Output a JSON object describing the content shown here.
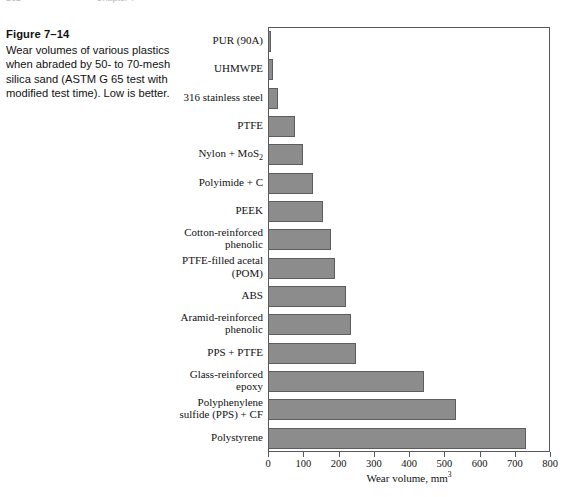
{
  "page_header": {
    "left": "262",
    "right": "Chapter 7"
  },
  "caption": {
    "figure_number": "Figure 7–14",
    "description": "Wear volumes of various plastics when abraded by 50- to 70-mesh silica sand (ASTM G 65 test with modified test time). Low is better."
  },
  "colors": {
    "bar_fill": "#8c8c8c",
    "bar_stroke": "#5d5d5d",
    "axis": "#58585a",
    "text": "#111111"
  },
  "chart_data": {
    "type": "bar",
    "orientation": "horizontal",
    "title": "",
    "xlabel": "Wear volume, mm³",
    "ylabel": "",
    "xlim": [
      0,
      800
    ],
    "xticks": [
      0,
      100,
      200,
      300,
      400,
      500,
      600,
      700,
      800
    ],
    "grid": false,
    "legend": null,
    "categories": [
      "PUR (90A)",
      "UHMWPE",
      "316 stainless steel",
      "PTFE",
      "Nylon + MoS2",
      "Polyimide + C",
      "PEEK",
      "Cotton-reinforced\nphenolic",
      "PTFE-filled acetal\n(POM)",
      "ABS",
      "Aramid-reinforced\nphenolic",
      "PPS + PTFE",
      "Glass-reinforced\nepoxy",
      "Polyphenylene\nsulfide (PPS) + CF",
      "Polystyrene"
    ],
    "values": [
      8,
      14,
      28,
      77,
      99,
      128,
      156,
      179,
      190,
      221,
      236,
      250,
      443,
      533,
      733
    ]
  }
}
